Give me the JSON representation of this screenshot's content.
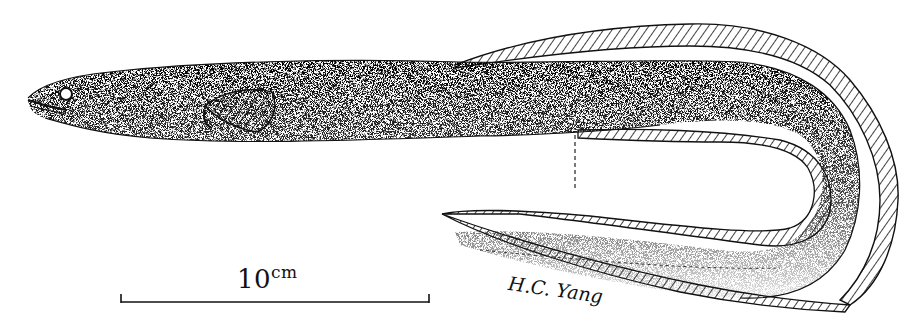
{
  "figure": {
    "scale_bar": {
      "value": "10",
      "unit": "cm"
    },
    "signature": "H.C. Yang",
    "colors": {
      "ink": "#111111",
      "paper": "#ffffff"
    }
  }
}
